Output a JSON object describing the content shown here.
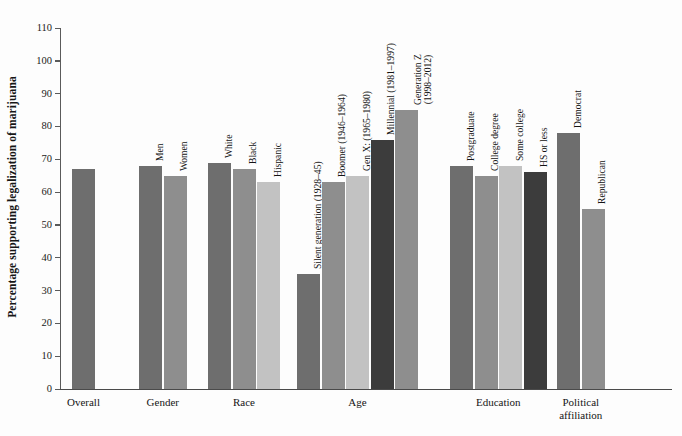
{
  "chart_data": {
    "type": "bar",
    "title": "",
    "xlabel": "",
    "ylabel": "Percentage supporting legalization of marijuana",
    "ylim": [
      0,
      110
    ],
    "yticks": [
      0,
      10,
      20,
      30,
      40,
      50,
      60,
      70,
      80,
      90,
      100,
      110
    ],
    "grid": false,
    "legend": "none",
    "categories": [
      "Overall",
      "Gender",
      "Race",
      "Age",
      "Education",
      "Political\naffiliation"
    ],
    "groups": [
      {
        "name": "Overall",
        "label": "Overall",
        "bars": [
          {
            "label": "",
            "value": 67,
            "color": "#6e6e6e"
          }
        ]
      },
      {
        "name": "Gender",
        "label": "Gender",
        "bars": [
          {
            "label": "Men",
            "value": 68,
            "color": "#6e6e6e"
          },
          {
            "label": "Women",
            "value": 65,
            "color": "#8e8e8e"
          }
        ]
      },
      {
        "name": "Race",
        "label": "Race",
        "bars": [
          {
            "label": "White",
            "value": 69,
            "color": "#6e6e6e"
          },
          {
            "label": "Black",
            "value": 67,
            "color": "#8e8e8e"
          },
          {
            "label": "Hispanic",
            "value": 63,
            "color": "#c2c2c2"
          }
        ]
      },
      {
        "name": "Age",
        "label": "Age",
        "bars": [
          {
            "label": "Silent generation (1928–45)",
            "value": 35,
            "color": "#6e6e6e"
          },
          {
            "label": "Boomer (1946–1964)",
            "value": 63,
            "color": "#8e8e8e"
          },
          {
            "label": "Gen X: (1965–1980)",
            "value": 65,
            "color": "#c2c2c2"
          },
          {
            "label": "Millennial (1981–1997)",
            "value": 76,
            "color": "#3c3c3c"
          },
          {
            "label": "Generation Z\n(1998–2012)",
            "value": 85,
            "color": "#8e8e8e"
          }
        ]
      },
      {
        "name": "Education",
        "label": "Education",
        "bars": [
          {
            "label": "Postgraduate",
            "value": 68,
            "color": "#6e6e6e"
          },
          {
            "label": "College degree",
            "value": 65,
            "color": "#8e8e8e"
          },
          {
            "label": "Some college",
            "value": 68,
            "color": "#c2c2c2"
          },
          {
            "label": "HS or less",
            "value": 66,
            "color": "#3c3c3c"
          }
        ]
      },
      {
        "name": "Political affiliation",
        "label": "Political\naffiliation",
        "bars": [
          {
            "label": "Democrat",
            "value": 78,
            "color": "#6e6e6e"
          },
          {
            "label": "Republican",
            "value": 55,
            "color": "#8e8e8e"
          }
        ]
      }
    ]
  },
  "colors": {
    "dark": "#3c3c3c",
    "mid_dark": "#6e6e6e",
    "mid": "#8e8e8e",
    "light": "#c2c2c2",
    "axis": "#4a4a4a",
    "background": "#fdfdfd",
    "text": "#151515"
  }
}
